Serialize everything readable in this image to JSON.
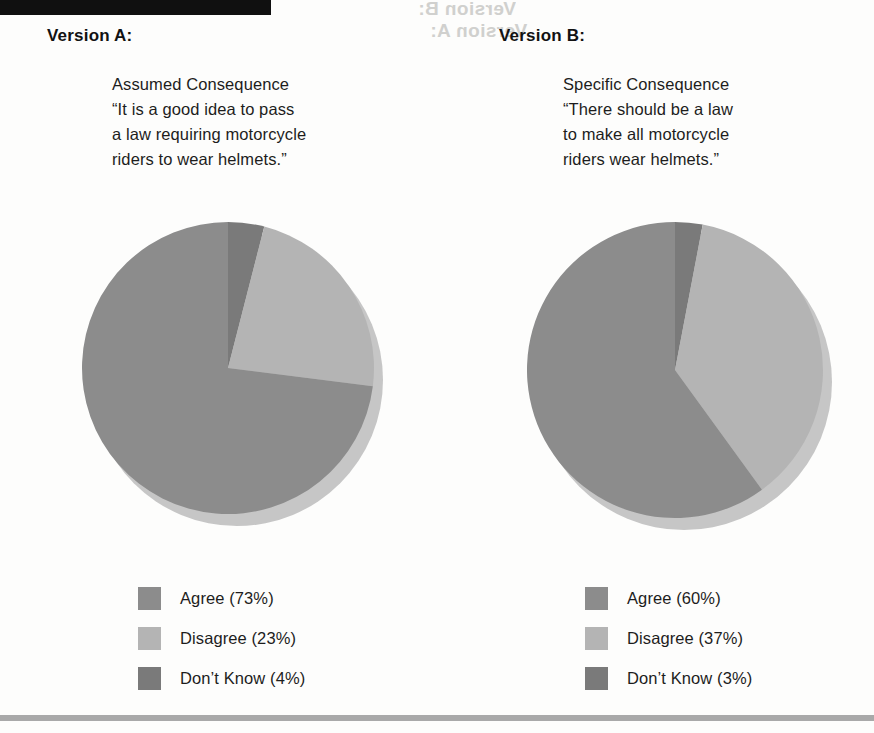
{
  "page": {
    "background": "#fdfdfc",
    "top_bar_color": "#101010",
    "bottom_rule_color": "#a9a9a9"
  },
  "bleed_through": {
    "line1": "Version B:",
    "line2": "Version A:"
  },
  "colors": {
    "agree": "#8c8c8c",
    "disagree": "#b4b4b4",
    "dont_know": "#7a7a7a",
    "shadow": "#c6c6c6",
    "text": "#1d1d1d"
  },
  "panels": [
    {
      "title": "Version A:",
      "question": "Assumed Consequence\n“It is a good idea to pass\na law requiring motorcycle\nriders to wear helmets.”",
      "legend": [
        {
          "label": "Agree (73%)",
          "color": "#8c8c8c"
        },
        {
          "label": "Disagree (23%)",
          "color": "#b4b4b4"
        },
        {
          "label": "Don’t Know (4%)",
          "color": "#7a7a7a"
        }
      ]
    },
    {
      "title": "Version B:",
      "question": "Specific Consequence\n“There should be a law\nto make all motorcycle\nriders wear helmets.”",
      "legend": [
        {
          "label": "Agree (60%)",
          "color": "#8c8c8c"
        },
        {
          "label": "Disagree (37%)",
          "color": "#b4b4b4"
        },
        {
          "label": "Don’t Know (3%)",
          "color": "#7a7a7a"
        }
      ]
    }
  ],
  "chart_data": [
    {
      "type": "pie",
      "title": "Version A: Assumed Consequence",
      "categories": [
        "Don't Know",
        "Disagree",
        "Agree"
      ],
      "values": [
        4,
        23,
        73
      ],
      "colors": [
        "#7a7a7a",
        "#b4b4b4",
        "#8c8c8c"
      ],
      "unit": "%",
      "start_angle_deg": 0,
      "direction": "clockwise",
      "radius": 146,
      "cx": 146,
      "cy": 182,
      "shadow_offset": [
        9,
        12
      ],
      "legend_position": "bottom"
    },
    {
      "type": "pie",
      "title": "Version B: Specific Consequence",
      "categories": [
        "Don't Know",
        "Disagree",
        "Agree"
      ],
      "values": [
        3,
        37,
        60
      ],
      "colors": [
        "#7a7a7a",
        "#b4b4b4",
        "#8c8c8c"
      ],
      "unit": "%",
      "start_angle_deg": 0,
      "direction": "clockwise",
      "radius": 148,
      "cx": 148,
      "cy": 184,
      "shadow_offset": [
        9,
        12
      ],
      "legend_position": "bottom"
    }
  ]
}
